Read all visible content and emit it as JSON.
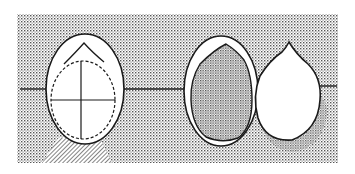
{
  "figure": {
    "title": "",
    "colors": {
      "background": "#ffffff",
      "stipple": "#555555",
      "stroke": "#1a1a1a",
      "fill_white": "#ffffff"
    },
    "panels": [
      {
        "id": "left-egg",
        "label": "",
        "features": [
          "outer-shell",
          "dashed-inner-outline",
          "crosshair",
          "hatched-shadow"
        ]
      },
      {
        "id": "middle-egg",
        "label": "",
        "features": [
          "outer-ring",
          "stippled-core"
        ]
      },
      {
        "id": "right-drop",
        "label": "",
        "features": [
          "drop-shape",
          "shadow-stipple"
        ]
      }
    ]
  }
}
